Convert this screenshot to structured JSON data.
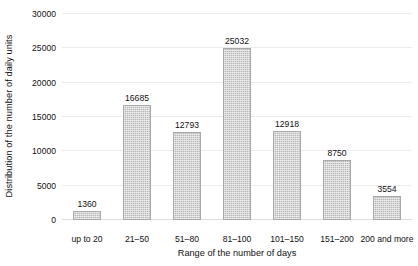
{
  "chart_data": {
    "type": "bar",
    "title": "",
    "xlabel": "Range of the number of days",
    "ylabel": "Distribution of the number of daily units",
    "categories": [
      "up to 20",
      "21–50",
      "51–80",
      "81–100",
      "101–150",
      "151–200",
      "200 and more"
    ],
    "values": [
      1360,
      16685,
      12793,
      25032,
      12918,
      8750,
      3554
    ],
    "value_labels": [
      "1360",
      "16685",
      "12793",
      "25032",
      "12918",
      "8750",
      "3554"
    ],
    "ylim": [
      0,
      30000
    ],
    "yticks": [
      0,
      5000,
      10000,
      15000,
      20000,
      25000,
      30000
    ],
    "ytick_labels": [
      "0",
      "5000",
      "10000",
      "15000",
      "20000",
      "25000",
      "30000"
    ],
    "grid": true,
    "legend": "none",
    "bar_color": "#b8b8b8",
    "bar_edge_color": "#a9a9a9",
    "gridline_color": "#ececed",
    "text_color": "#111111",
    "background": "#ffffff"
  }
}
